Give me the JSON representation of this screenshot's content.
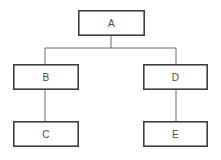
{
  "diagram": {
    "type": "tree",
    "title": "",
    "canvas": {
      "width": 221,
      "height": 160,
      "background": "#ffffff"
    },
    "style": {
      "node_fill": "#ffffff",
      "node_stroke": "#3f3f3f",
      "node_stroke_width": 1.6,
      "edge_stroke": "#6b6b6b",
      "edge_stroke_width": 1,
      "label_color": "#4a4a4a",
      "label_font_size": 10
    },
    "nodes": [
      {
        "id": "A",
        "label": "A",
        "x": 78,
        "y": 10,
        "w": 67,
        "h": 26,
        "level": 0
      },
      {
        "id": "B",
        "label": "B",
        "x": 13,
        "y": 64,
        "w": 66,
        "h": 26,
        "level": 1
      },
      {
        "id": "D",
        "label": "D",
        "x": 143,
        "y": 64,
        "w": 65,
        "h": 26,
        "level": 1
      },
      {
        "id": "C",
        "label": "C",
        "x": 13,
        "y": 121,
        "w": 66,
        "h": 26,
        "level": 2
      },
      {
        "id": "E",
        "label": "E",
        "x": 143,
        "y": 121,
        "w": 65,
        "h": 26,
        "level": 2
      }
    ],
    "edges": [
      {
        "id": "A-B",
        "from": "A",
        "to": "B",
        "kind": "orthogonal"
      },
      {
        "id": "A-D",
        "from": "A",
        "to": "D",
        "kind": "orthogonal"
      },
      {
        "id": "B-C",
        "from": "B",
        "to": "C",
        "kind": "straight"
      },
      {
        "id": "D-E",
        "from": "D",
        "to": "E",
        "kind": "straight"
      }
    ],
    "connector_geometry": {
      "trunk_x": 111,
      "trunk_top_y": 36,
      "bus_y": 48,
      "bus_left_x": 45,
      "bus_right_x": 176,
      "left_drop_to_y": 64,
      "right_drop_to_y": 64,
      "b_child_x": 45,
      "b_child_top_y": 90,
      "b_child_bottom_y": 121,
      "d_child_x": 176,
      "d_child_top_y": 90,
      "d_child_bottom_y": 121
    }
  }
}
